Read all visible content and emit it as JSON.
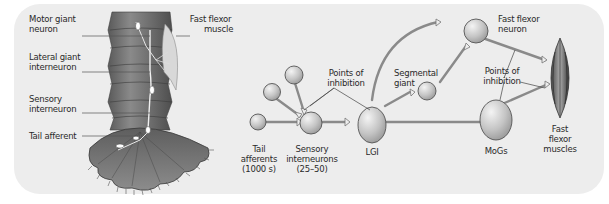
{
  "anatomy": {
    "labels": {
      "motor_giant": "Motor giant",
      "motor_giant_2": "neuron",
      "lateral_giant": "Lateral giant",
      "lateral_giant_2": "interneuron",
      "sensory": "Sensory",
      "sensory_2": "interneuron",
      "tail_afferent": "Tail afferent",
      "fast_flexor": "Fast flexor",
      "fast_flexor_2": "muscle"
    }
  },
  "circuit": {
    "nodes": {
      "tail_afferents": [
        "Tail",
        "afferents",
        "(1000 s)"
      ],
      "sensory_interneurons": [
        "Sensory",
        "interneurons",
        "(25–50)"
      ],
      "lgi": "LGI",
      "segmental_giant": [
        "Segmental",
        "giant"
      ],
      "fast_flexor_neuron": [
        "Fast flexor",
        "neuron"
      ],
      "mogs": "MoGs",
      "fast_flexor_muscles": [
        "Fast",
        "flexor",
        "muscles"
      ]
    },
    "annotations": {
      "points_of_inhibition_1": [
        "Points of",
        "inhibition"
      ],
      "points_of_inhibition_2": [
        "Points of",
        "inhibition"
      ]
    }
  },
  "colors": {
    "panel_bg": "#ededed",
    "tail_body": "#6e6e6e",
    "neuron_fill": "#c9c9c9",
    "neuron_stroke": "#555555",
    "axon": "#8a8a8a",
    "text": "#2a2a2a"
  }
}
